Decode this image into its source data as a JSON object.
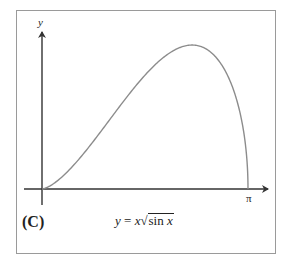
{
  "figure": {
    "panel_label": "(C)",
    "y_axis_label": "y",
    "x_axis_end_label": "π",
    "equation": {
      "lhs": "y",
      "equals": " = ",
      "factor": "x",
      "radical_sign": "√",
      "radicand_fn": "sin",
      "radicand_var": "x"
    },
    "colors": {
      "curve": "#8c8c8c",
      "axes": "#333333",
      "frame": "#9a9a9a"
    }
  },
  "chart_data": {
    "type": "line",
    "title": "y = x√sin x",
    "xlabel": "",
    "ylabel": "y",
    "x_ticks": [
      "π"
    ],
    "xlim": [
      0,
      3.14159
    ],
    "ylim": [
      0,
      2.0
    ],
    "grid": false,
    "legend": null,
    "series": [
      {
        "name": "y = x√sin x",
        "x": [
          0,
          0.25,
          0.5,
          0.75,
          1.0,
          1.25,
          1.5,
          1.75,
          2.0,
          2.289,
          2.5,
          2.7,
          2.8,
          2.9,
          3.0,
          3.05,
          3.1,
          3.13,
          3.14159
        ],
        "y": [
          0,
          0.124,
          0.346,
          0.621,
          0.917,
          1.191,
          1.498,
          1.737,
          1.907,
          1.987,
          1.934,
          1.768,
          1.621,
          1.424,
          1.127,
          0.934,
          0.632,
          0.338,
          0
        ]
      }
    ]
  }
}
